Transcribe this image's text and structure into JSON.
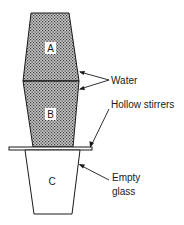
{
  "diagram": {
    "glass_a": {
      "label": "A"
    },
    "glass_b": {
      "label": "B"
    },
    "glass_c": {
      "label": "C"
    },
    "labels": {
      "water": "Water",
      "hollow_stirrers": "Hollow stirrers",
      "empty_line1": "Empty",
      "empty_line2": "glass"
    },
    "colors": {
      "stroke": "#1a1a1a",
      "water_fill": "#9a9a9a"
    }
  }
}
